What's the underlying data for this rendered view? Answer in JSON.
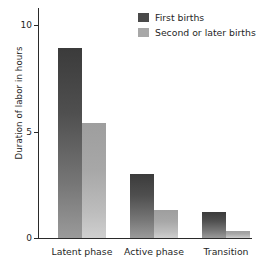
{
  "chart_data": {
    "type": "bar",
    "title": "",
    "subtitle": "",
    "xlabel": "",
    "ylabel": "Duration of labor in hours",
    "categories": [
      "Latent phase",
      "Active phase",
      "Transition"
    ],
    "series": [
      {
        "name": "First births",
        "color": "#4a4a4a",
        "values": [
          8.9,
          3.0,
          1.2
        ]
      },
      {
        "name": "Second or later births",
        "color": "#a8a8a8",
        "values": [
          5.4,
          1.3,
          0.35
        ]
      }
    ],
    "ylim": [
      0,
      10.8
    ],
    "yticks": [
      0,
      5,
      10
    ],
    "ytick_labels": [
      "0",
      "5",
      "10"
    ],
    "grid": false,
    "legend_position": "top-right",
    "annotations": []
  },
  "legend": {
    "items": [
      {
        "label": "First births",
        "swatch": "#4a4a4a"
      },
      {
        "label": "Second or later births",
        "swatch": "#a8a8a8"
      }
    ]
  }
}
